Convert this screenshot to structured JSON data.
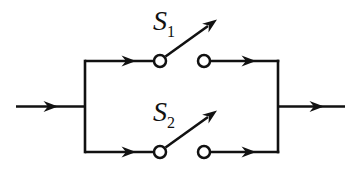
{
  "colors": {
    "line": "#111111",
    "background": "#ffffff"
  },
  "switches": [
    {
      "base": "S",
      "sub": "1"
    },
    {
      "base": "S",
      "sub": "2"
    }
  ]
}
